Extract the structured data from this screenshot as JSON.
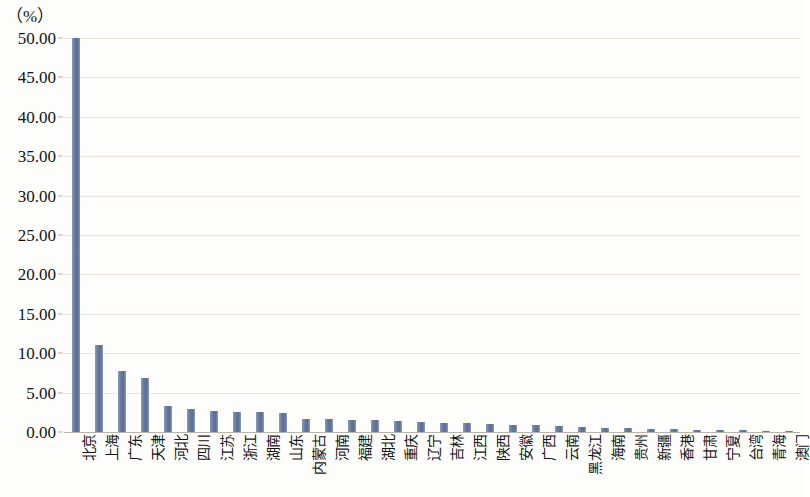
{
  "chart_data": {
    "type": "bar",
    "title": "",
    "subtitle": "",
    "xlabel": "",
    "ylabel": "（%）",
    "unit_label": "（%）",
    "ylim": [
      0,
      50
    ],
    "ytick_step": 5,
    "ytick_labels": [
      "50.00",
      "45.00",
      "40.00",
      "35.00",
      "30.00",
      "25.00",
      "20.00",
      "15.00",
      "10.00",
      "5.00",
      "0.00"
    ],
    "ytick_values": [
      50,
      45,
      40,
      35,
      30,
      25,
      20,
      15,
      10,
      5,
      0
    ],
    "grid": true,
    "grid_axis": "y",
    "legend": false,
    "legend_position": "none",
    "bar_color": "#6b7fa9",
    "grid_color": "#e8e4dc",
    "axis_color": "#b9b4aa",
    "categories": [
      "北京",
      "上海",
      "广东",
      "天津",
      "河北",
      "四川",
      "江苏",
      "浙江",
      "湖南",
      "山东",
      "内蒙古",
      "河南",
      "福建",
      "湖北",
      "重庆",
      "辽宁",
      "吉林",
      "江西",
      "陕西",
      "安徽",
      "广西",
      "云南",
      "黑龙江",
      "海南",
      "贵州",
      "新疆",
      "香港",
      "甘肃",
      "宁夏",
      "台湾",
      "青海",
      "澳门"
    ],
    "values": [
      50.0,
      11.0,
      7.7,
      6.8,
      3.3,
      2.9,
      2.7,
      2.6,
      2.5,
      2.4,
      1.7,
      1.6,
      1.55,
      1.5,
      1.4,
      1.3,
      1.2,
      1.1,
      1.0,
      0.95,
      0.85,
      0.75,
      0.65,
      0.55,
      0.48,
      0.42,
      0.36,
      0.3,
      0.25,
      0.2,
      0.14,
      0.09
    ],
    "series": [
      {
        "name": "占比",
        "values": [
          50.0,
          11.0,
          7.7,
          6.8,
          3.3,
          2.9,
          2.7,
          2.6,
          2.5,
          2.4,
          1.7,
          1.6,
          1.55,
          1.5,
          1.4,
          1.3,
          1.2,
          1.1,
          1.0,
          0.95,
          0.85,
          0.75,
          0.65,
          0.55,
          0.48,
          0.42,
          0.36,
          0.3,
          0.25,
          0.2,
          0.14,
          0.09
        ]
      }
    ]
  }
}
